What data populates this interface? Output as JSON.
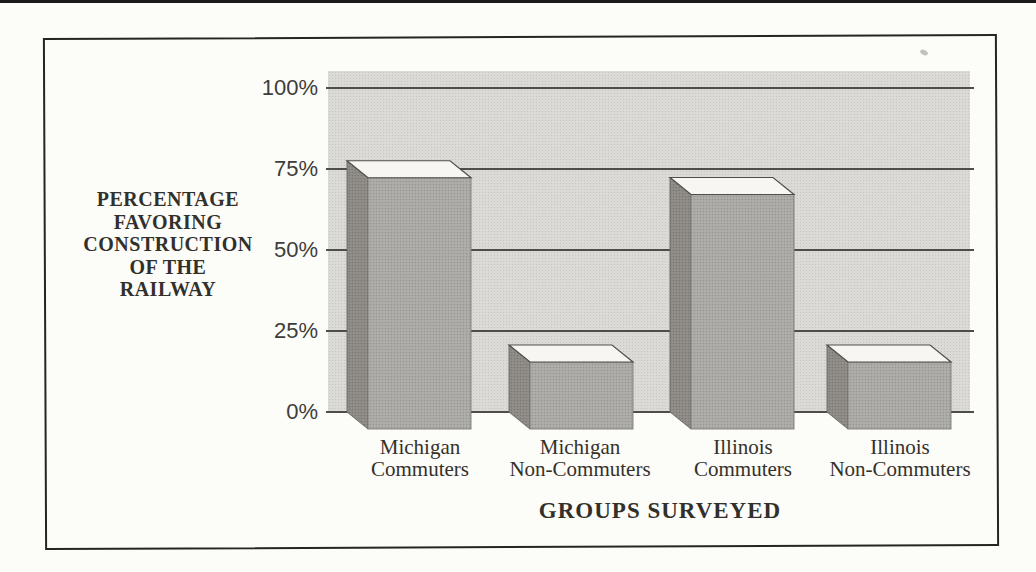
{
  "chart_data": {
    "type": "bar",
    "view": "3d-scanned-print",
    "title": "",
    "xlabel": "GROUPS SURVEYED",
    "ylabel": "PERCENTAGE FAVORING CONSTRUCTION OF THE RAILWAY",
    "ylabel_lines": [
      "PERCENTAGE",
      "FAVORING",
      "CONSTRUCTION",
      "OF THE",
      "RAILWAY"
    ],
    "categories": [
      "Michigan Commuters",
      "Michigan Non-Commuters",
      "Illinois Commuters",
      "Illinois Non-Commuters"
    ],
    "category_lines": [
      [
        "Michigan",
        "Commuters"
      ],
      [
        "Michigan",
        "Non-Commuters"
      ],
      [
        "Illinois",
        "Commuters"
      ],
      [
        "Illinois",
        "Non-Commuters"
      ]
    ],
    "values": [
      75,
      20,
      70,
      20
    ],
    "unit": "%",
    "ytick_labels": [
      "100%",
      "75%",
      "50%",
      "25%",
      "0%"
    ],
    "ytick_values": [
      100,
      75,
      50,
      25,
      0
    ],
    "ylim": [
      0,
      100
    ],
    "grid": true,
    "legend": false,
    "colors": {
      "page_bg": "#fcfcf9",
      "frame_border": "#26251f",
      "wall_bg": "#dbdad6",
      "gridline": "#4e4d4a",
      "bar_front": "#aaa8a4",
      "bar_side": "#8d8b86",
      "bar_top": "#f7f6f2",
      "text": "#32302b"
    }
  }
}
